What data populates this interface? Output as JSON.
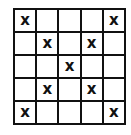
{
  "grid": {
    "rows": 5,
    "cols": 5,
    "mark": "x",
    "cells": [
      [
        "x",
        "",
        "",
        "",
        "x"
      ],
      [
        "",
        "x",
        "",
        "x",
        ""
      ],
      [
        "",
        "",
        "x",
        "",
        ""
      ],
      [
        "",
        "x",
        "",
        "x",
        ""
      ],
      [
        "x",
        "",
        "",
        "",
        "x"
      ]
    ]
  }
}
